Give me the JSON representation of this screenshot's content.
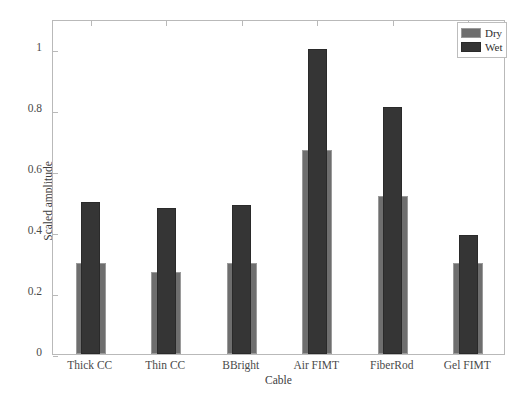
{
  "chart_data": {
    "type": "bar",
    "title": "",
    "xlabel": "Cable",
    "ylabel": "Scaled amplitude",
    "categories": [
      "Thick CC",
      "Thin CC",
      "BBright",
      "Air FIMT",
      "FiberRod",
      "Gel FIMT"
    ],
    "series": [
      {
        "name": "Dry",
        "color": "#6e6e6e",
        "values": [
          0.3,
          0.27,
          0.3,
          0.67,
          0.52,
          0.3
        ]
      },
      {
        "name": "Wet",
        "color": "#353535",
        "values": [
          0.5,
          0.48,
          0.49,
          1.0,
          0.81,
          0.39
        ]
      }
    ],
    "ylim": [
      0,
      1.1
    ],
    "yticks": [
      "0",
      "0.2",
      "0.4",
      "0.6",
      "0.8",
      "1"
    ],
    "ytick_values": [
      0,
      0.2,
      0.4,
      0.6,
      0.8,
      1
    ],
    "grid": false,
    "legend_position": "top-right",
    "bar_style": "overlapping"
  },
  "legend": {
    "entries": [
      {
        "label": "Dry"
      },
      {
        "label": "Wet"
      }
    ]
  },
  "axes": {
    "y_title": "Scaled amplitude",
    "x_title": "Cable"
  }
}
